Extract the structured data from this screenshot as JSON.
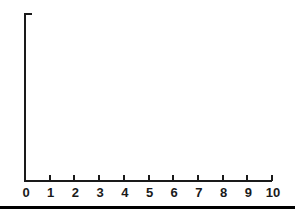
{
  "figure": {
    "background_color": "#ffffff",
    "axis_color": "#1a1a1a",
    "rule_color": "#000000",
    "width": 295,
    "height": 215
  },
  "axes": {
    "y_axis_name": "y-axis",
    "x_axis_name": "x-axis",
    "y_axis_top_cap": "tick",
    "x_tick_labels": [
      "0",
      "1",
      "2",
      "3",
      "4",
      "5",
      "6",
      "7",
      "8",
      "9",
      "10"
    ]
  },
  "chart_data": {
    "type": "line",
    "title": "",
    "subtitle": "",
    "xlabel": "",
    "ylabel": "",
    "x": [
      0,
      1,
      2,
      3,
      4,
      5,
      6,
      7,
      8,
      9,
      10
    ],
    "xtick_labels": [
      "0",
      "1",
      "2",
      "3",
      "4",
      "5",
      "6",
      "7",
      "8",
      "9",
      "10"
    ],
    "ytick_labels": [],
    "series": [],
    "xlim": [
      0,
      10
    ],
    "ylim": [
      0,
      1
    ],
    "grid": false,
    "legend": false,
    "legend_position": "none",
    "annotations": []
  }
}
